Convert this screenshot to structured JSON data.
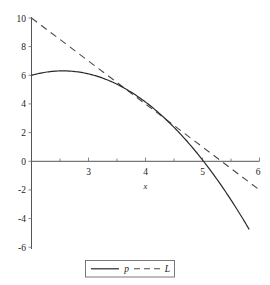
{
  "chart_data": {
    "type": "line",
    "title": "",
    "xlabel": "x",
    "ylabel": "",
    "xlim": [
      2,
      6
    ],
    "ylim": [
      -6.2,
      10
    ],
    "grid": false,
    "legend_position": "bottom-center",
    "x_ticks": [
      3,
      4,
      5,
      6
    ],
    "x_tick_labels": [
      "3",
      "4",
      "5",
      "6"
    ],
    "x_minor_ticks": [
      2.5,
      3.5,
      4.5,
      5.5
    ],
    "y_ticks": [
      10,
      8,
      6,
      4,
      2,
      0,
      -2,
      -4,
      -6
    ],
    "y_tick_labels": [
      "10",
      "8",
      "6",
      "4",
      "2",
      "0",
      "-2",
      "-4",
      "-6"
    ],
    "series": [
      {
        "name": "p",
        "style": "solid",
        "color": "#2a2a2a",
        "kind": "parabola",
        "equation_vertex": {
          "a": -1.035,
          "h": 2.55,
          "k": 6.31
        },
        "x_start": 2.0,
        "x_end": 5.82,
        "points": [
          {
            "x": 2.0,
            "y": 6.0
          },
          {
            "x": 2.25,
            "y": 6.22
          },
          {
            "x": 2.55,
            "y": 6.31
          },
          {
            "x": 3.0,
            "y": 6.1
          },
          {
            "x": 3.5,
            "y": 5.4
          },
          {
            "x": 4.0,
            "y": 4.2
          },
          {
            "x": 4.5,
            "y": 2.5
          },
          {
            "x": 5.0,
            "y": 0.3
          },
          {
            "x": 5.02,
            "y": 0.0
          },
          {
            "x": 5.5,
            "y": -2.3
          },
          {
            "x": 5.82,
            "y": -6.1
          }
        ]
      },
      {
        "name": "L",
        "style": "dashed",
        "color": "#4a4a4a",
        "kind": "line",
        "equation": {
          "slope": -3,
          "intercept": 16
        },
        "x_start": 2.0,
        "x_end": 6.0,
        "points": [
          {
            "x": 2.0,
            "y": 10.0
          },
          {
            "x": 4.0,
            "y": 4.0
          },
          {
            "x": 5.333,
            "y": 0.0
          },
          {
            "x": 6.0,
            "y": -2.0
          }
        ]
      }
    ],
    "legend": [
      {
        "label": "p",
        "style": "solid"
      },
      {
        "label": "L",
        "style": "dashed"
      }
    ]
  }
}
